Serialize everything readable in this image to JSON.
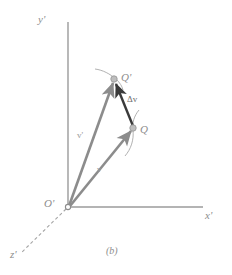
{
  "figure": {
    "caption": "(b)",
    "background_color": "#ffffff",
    "axis_color": "#9b9b9b",
    "vector_color": "#8c8c8c",
    "delta_vector_color": "#3a3a3a",
    "curve_color": "#a8a8a8",
    "point_fill_color": "#bdbdbd",
    "label_color": "#8d8d8d"
  },
  "axes": {
    "y": {
      "label": "y'",
      "from": [
        68,
        207
      ],
      "to": [
        68,
        22
      ]
    },
    "x": {
      "label": "x'",
      "from": [
        68,
        207
      ],
      "to": [
        203,
        207
      ]
    },
    "z": {
      "label": "z'",
      "from": [
        68,
        207
      ],
      "to": [
        22,
        252
      ],
      "style": "dashed"
    }
  },
  "origin": {
    "label": "O'",
    "position": [
      68,
      207
    ],
    "marker": "open-circle"
  },
  "points": [
    {
      "id": "q-prime",
      "label": "Q'",
      "position": [
        114,
        79
      ],
      "marker": "filled-circle"
    },
    {
      "id": "q",
      "label": "Q",
      "position": [
        133,
        128
      ],
      "marker": "filled-circle"
    }
  ],
  "vectors": [
    {
      "id": "v-prime",
      "label": "v'",
      "from": [
        68,
        207
      ],
      "to": [
        114,
        79
      ],
      "color": "#8c8c8c",
      "label_position": [
        77,
        131
      ]
    },
    {
      "id": "v",
      "label": "v",
      "from": [
        68,
        207
      ],
      "to": [
        133,
        128
      ],
      "color": "#8c8c8c",
      "label_position": [
        97,
        165
      ]
    },
    {
      "id": "delta-v",
      "label": "Δv",
      "from": [
        133,
        128
      ],
      "to": [
        114,
        79
      ],
      "color": "#3a3a3a",
      "label_position": [
        127,
        95
      ]
    }
  ],
  "curves": [
    {
      "id": "trajectory-through-q-prime",
      "through_point": "q-prime"
    },
    {
      "id": "trajectory-through-q",
      "through_point": "q"
    }
  ]
}
